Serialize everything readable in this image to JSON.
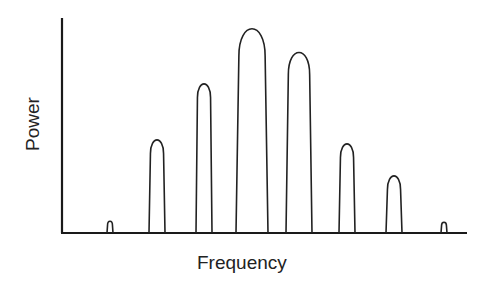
{
  "chart_data": {
    "type": "line",
    "title": "",
    "xlabel": "Frequency",
    "ylabel": "Power",
    "grid": false,
    "legend": null,
    "ticks": {
      "x": [],
      "y": []
    },
    "peaks": [
      {
        "index": 1,
        "x": 110,
        "height": 12,
        "base_width": 6
      },
      {
        "index": 2,
        "x": 157,
        "height": 94,
        "base_width": 16
      },
      {
        "index": 3,
        "x": 204,
        "height": 150,
        "base_width": 16
      },
      {
        "index": 4,
        "x": 252,
        "height": 206,
        "base_width": 32
      },
      {
        "index": 5,
        "x": 299,
        "height": 182,
        "base_width": 26
      },
      {
        "index": 6,
        "x": 347,
        "height": 90,
        "base_width": 16
      },
      {
        "index": 7,
        "x": 394,
        "height": 58,
        "base_width": 16
      },
      {
        "index": 8,
        "x": 444,
        "height": 11,
        "base_width": 6
      }
    ],
    "relative_heights": [
      0.06,
      0.46,
      0.73,
      1.0,
      0.88,
      0.44,
      0.28,
      0.05
    ],
    "axes": {
      "origin": [
        62,
        233
      ],
      "y_top": 18,
      "x_end": 467
    }
  },
  "labels": {
    "x": "Frequency",
    "y": "Power"
  }
}
